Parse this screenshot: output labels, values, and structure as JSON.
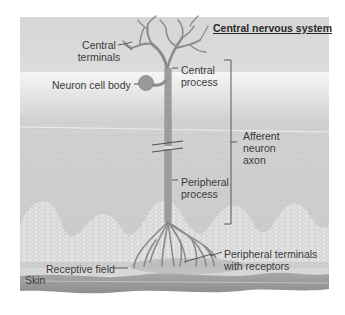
{
  "diagram": {
    "type": "anatomy-illustration",
    "subject": "afferent neuron",
    "region_label": "Central nervous system",
    "labels": {
      "central_terminals": [
        "Central",
        "terminals"
      ],
      "neuron_cell_body": "Neuron cell body",
      "central_process": [
        "Central",
        "process"
      ],
      "afferent_neuron_axon": [
        "Afferent",
        "neuron",
        "axon"
      ],
      "peripheral_process": [
        "Peripheral",
        "process"
      ],
      "peripheral_terminals": [
        "Peripheral terminals",
        "with receptors"
      ],
      "receptive_field": "Receptive field",
      "skin": "Skin"
    },
    "colors": {
      "cns_band": "#d9d9d9",
      "tissue": "#cfcfcf",
      "dermis_cells": "#e4e4e4",
      "skin_band": "#9a9a9a",
      "neuron": "#9c9c9c",
      "neuron_outline": "#707070",
      "text": "#3a3a3a",
      "leader": "#4a4a4a"
    }
  }
}
